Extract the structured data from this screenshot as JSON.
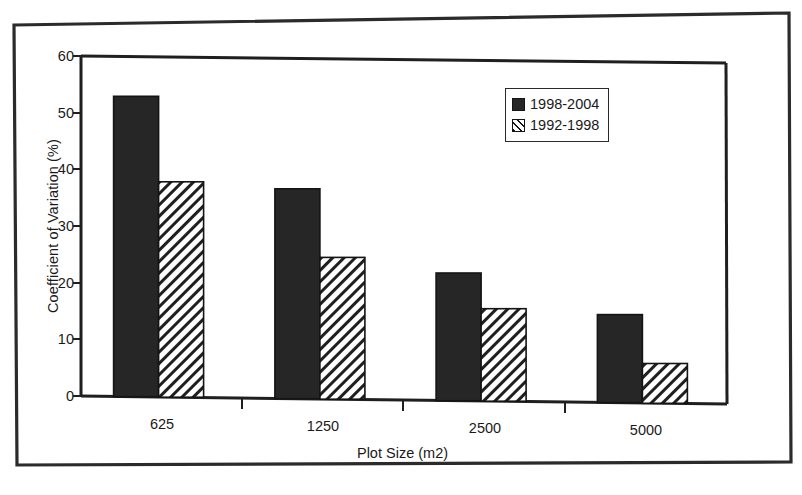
{
  "chart_data": {
    "type": "bar",
    "title": "",
    "subtitle": "",
    "xlabel": "Plot Size (m2)",
    "ylabel": "Coefficient of Variation (%)",
    "categories": [
      "625",
      "1250",
      "2500",
      "5000"
    ],
    "series": [
      {
        "name": "1998-2004",
        "style": "solid-black",
        "values": [
          53,
          37,
          22.5,
          15.5
        ]
      },
      {
        "name": "1992-1998",
        "style": "diagonal-hatch",
        "values": [
          38,
          25,
          16.3,
          7
        ]
      }
    ],
    "ylim": [
      0,
      60
    ],
    "y_ticks": [
      0,
      10,
      20,
      30,
      40,
      50,
      60
    ],
    "y_tick_labels": [
      "0",
      "10",
      "20",
      "30",
      "40",
      "50",
      "60"
    ],
    "grid": false,
    "legend_position": "top-right",
    "axis_color": "#1a1a1a",
    "series_colors": [
      "#262626",
      "#ffffff"
    ]
  },
  "legend": {
    "entries": [
      {
        "label": "1998-2004",
        "swatch": "solid-swatch-icon"
      },
      {
        "label": "1992-1998",
        "swatch": "hatched-swatch-icon"
      }
    ]
  },
  "figure": {
    "outer_frame_name": "scanned-page-border"
  }
}
